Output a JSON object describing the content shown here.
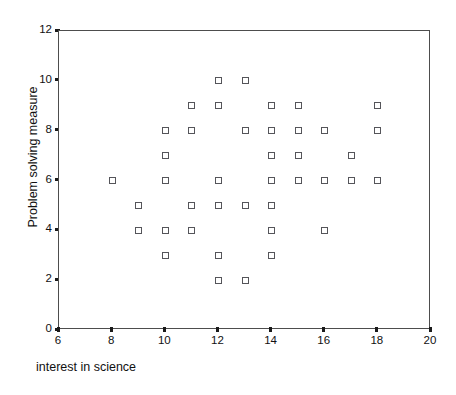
{
  "chart_data": {
    "type": "scatter",
    "title": "",
    "xlabel": "interest in science",
    "ylabel": "Problem solving measure",
    "xlim": [
      6,
      20
    ],
    "ylim": [
      0,
      12
    ],
    "xticks": [
      6,
      8,
      10,
      12,
      14,
      16,
      18,
      20
    ],
    "yticks": [
      0,
      2,
      4,
      6,
      8,
      10,
      12
    ],
    "grid": false,
    "legend": null,
    "marker": "open-square",
    "marker_color": "#55555a",
    "points": [
      {
        "x": 12,
        "y": 10
      },
      {
        "x": 13,
        "y": 10
      },
      {
        "x": 11,
        "y": 9
      },
      {
        "x": 12,
        "y": 9
      },
      {
        "x": 14,
        "y": 9
      },
      {
        "x": 15,
        "y": 9
      },
      {
        "x": 18,
        "y": 9
      },
      {
        "x": 10,
        "y": 8
      },
      {
        "x": 11,
        "y": 8
      },
      {
        "x": 13,
        "y": 8
      },
      {
        "x": 14,
        "y": 8
      },
      {
        "x": 15,
        "y": 8
      },
      {
        "x": 16,
        "y": 8
      },
      {
        "x": 18,
        "y": 8
      },
      {
        "x": 10,
        "y": 7
      },
      {
        "x": 14,
        "y": 7
      },
      {
        "x": 15,
        "y": 7
      },
      {
        "x": 17,
        "y": 7
      },
      {
        "x": 8,
        "y": 6
      },
      {
        "x": 10,
        "y": 6
      },
      {
        "x": 12,
        "y": 6
      },
      {
        "x": 14,
        "y": 6
      },
      {
        "x": 15,
        "y": 6
      },
      {
        "x": 16,
        "y": 6
      },
      {
        "x": 17,
        "y": 6
      },
      {
        "x": 18,
        "y": 6
      },
      {
        "x": 9,
        "y": 5
      },
      {
        "x": 11,
        "y": 5
      },
      {
        "x": 12,
        "y": 5
      },
      {
        "x": 13,
        "y": 5
      },
      {
        "x": 14,
        "y": 5
      },
      {
        "x": 9,
        "y": 4
      },
      {
        "x": 10,
        "y": 4
      },
      {
        "x": 11,
        "y": 4
      },
      {
        "x": 14,
        "y": 4
      },
      {
        "x": 16,
        "y": 4
      },
      {
        "x": 10,
        "y": 3
      },
      {
        "x": 12,
        "y": 3
      },
      {
        "x": 14,
        "y": 3
      },
      {
        "x": 12,
        "y": 2
      },
      {
        "x": 13,
        "y": 2
      }
    ]
  }
}
